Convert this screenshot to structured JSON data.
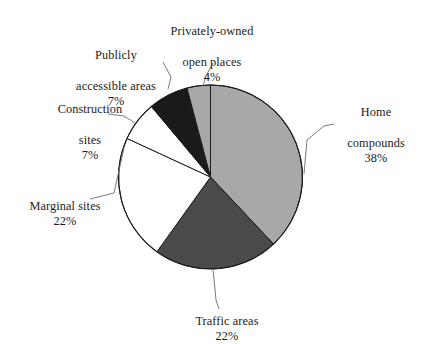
{
  "chart_data": {
    "type": "pie",
    "title": "",
    "subtitle": "",
    "xlabel": "",
    "ylabel": "",
    "legend_position": "none",
    "grid": false,
    "units": "percent",
    "start_angle_deg": 0,
    "direction": "clockwise",
    "categories": [
      "Home compounds",
      "Traffic areas",
      "Marginal sites",
      "Construction sites",
      "Publicly accessible areas",
      "Privately-owned open places"
    ],
    "values": [
      38,
      22,
      22,
      7,
      7,
      4
    ],
    "slices": [
      {
        "label": "Home compounds",
        "label_line1": "Home",
        "label_line2": "compounds",
        "value": 38,
        "percent_text": "38%",
        "color": "#a8a8a8",
        "start_deg": 0,
        "end_deg": 136.8
      },
      {
        "label": "Traffic areas",
        "label_line1": "Traffic areas",
        "label_line2": "",
        "value": 22,
        "percent_text": "22%",
        "color": "#4a4a4a",
        "start_deg": 136.8,
        "end_deg": 215.6
      },
      {
        "label": "Marginal sites",
        "label_line1": "Marginal sites",
        "label_line2": "",
        "value": 22,
        "percent_text": "22%",
        "color": "#ffffff",
        "start_deg": 215.6,
        "end_deg": 294.8
      },
      {
        "label": "Construction sites",
        "label_line1": "Construction",
        "label_line2": "sites",
        "value": 7,
        "percent_text": "7%",
        "color": "#ffffff",
        "start_deg": 294.8,
        "end_deg": 320.0
      },
      {
        "label": "Publicly accessible areas",
        "label_line1": "Publicly",
        "label_line2": "accessible areas",
        "value": 7,
        "percent_text": "7%",
        "color": "#1a1a1a",
        "start_deg": 320.0,
        "end_deg": 345.2
      },
      {
        "label": "Privately-owned open places",
        "label_line1": "Privately-owned",
        "label_line2": "open places",
        "value": 4,
        "percent_text": "4%",
        "color": "#a8a8a8",
        "start_deg": 345.2,
        "end_deg": 360.0
      }
    ]
  },
  "labels": {
    "home_compounds": {
      "line1": "Home",
      "line2": "compounds",
      "percent": "38%"
    },
    "traffic_areas": {
      "line1": "Traffic areas",
      "percent": "22%"
    },
    "marginal_sites": {
      "line1": "Marginal sites",
      "percent": "22%"
    },
    "construction_sites": {
      "line1": "Construction",
      "line2": "sites",
      "percent": "7%"
    },
    "publicly_accessible_areas": {
      "line1": "Publicly",
      "line2": "accessible areas",
      "percent": "7%"
    },
    "privately_owned_open_places": {
      "line1": "Privately-owned",
      "line2": "open places",
      "percent": "4%"
    }
  },
  "style": {
    "background": "#ffffff",
    "outline": "#1b1b1b",
    "leader_line": "#6b6b6b",
    "text": "#1b1b1b"
  }
}
